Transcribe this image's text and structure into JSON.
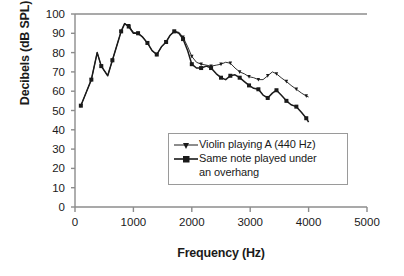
{
  "chart_data": {
    "type": "line",
    "title": "",
    "xlabel": "Frequency (Hz)",
    "ylabel": "Decibels (dB SPL)",
    "xlim": [
      0,
      5000
    ],
    "ylim": [
      0,
      100
    ],
    "xticks": [
      "0",
      "1000",
      "2000",
      "3000",
      "4000",
      "5000"
    ],
    "yticks": [
      "0",
      "10",
      "20",
      "30",
      "40",
      "50",
      "60",
      "70",
      "80",
      "90",
      "100"
    ],
    "grid": false,
    "legend_position": "inside-center-right",
    "series": [
      {
        "name": "Violin playing A (440 Hz)",
        "marker": "triangle-down",
        "color": "#1a1a1a",
        "points": [
          [
            100,
            52.5
          ],
          [
            200,
            60
          ],
          [
            280,
            66
          ],
          [
            380,
            80
          ],
          [
            450,
            73
          ],
          [
            560,
            68
          ],
          [
            640,
            76
          ],
          [
            730,
            85
          ],
          [
            790,
            91
          ],
          [
            850,
            95
          ],
          [
            920,
            94
          ],
          [
            1000,
            90.5
          ],
          [
            1080,
            90
          ],
          [
            1160,
            88
          ],
          [
            1240,
            85
          ],
          [
            1320,
            81
          ],
          [
            1400,
            79
          ],
          [
            1480,
            83
          ],
          [
            1560,
            85.5
          ],
          [
            1630,
            89
          ],
          [
            1700,
            91
          ],
          [
            1780,
            90.5
          ],
          [
            1850,
            88
          ],
          [
            1930,
            83
          ],
          [
            2000,
            78
          ],
          [
            2080,
            75
          ],
          [
            2160,
            74
          ],
          [
            2250,
            73.5
          ],
          [
            2330,
            73
          ],
          [
            2420,
            73.5
          ],
          [
            2500,
            74
          ],
          [
            2580,
            75
          ],
          [
            2660,
            74.5
          ],
          [
            2740,
            72
          ],
          [
            2820,
            70
          ],
          [
            2900,
            69
          ],
          [
            2980,
            67.5
          ],
          [
            3060,
            67
          ],
          [
            3140,
            66
          ],
          [
            3220,
            66
          ],
          [
            3300,
            68
          ],
          [
            3380,
            70
          ],
          [
            3450,
            69
          ],
          [
            3530,
            67
          ],
          [
            3620,
            65
          ],
          [
            3700,
            63
          ],
          [
            3790,
            61
          ],
          [
            3880,
            59
          ],
          [
            3960,
            57.5
          ],
          [
            4000,
            57
          ]
        ]
      },
      {
        "name": "Same note played under an overhang",
        "marker": "square",
        "color": "#1a1a1a",
        "points": [
          [
            100,
            52.5
          ],
          [
            200,
            60
          ],
          [
            280,
            66
          ],
          [
            380,
            80
          ],
          [
            450,
            73
          ],
          [
            560,
            68
          ],
          [
            640,
            76
          ],
          [
            730,
            85
          ],
          [
            790,
            91
          ],
          [
            850,
            95
          ],
          [
            920,
            93.5
          ],
          [
            1000,
            90
          ],
          [
            1080,
            90
          ],
          [
            1160,
            88
          ],
          [
            1240,
            85
          ],
          [
            1320,
            81
          ],
          [
            1400,
            79
          ],
          [
            1480,
            83
          ],
          [
            1560,
            85.5
          ],
          [
            1630,
            89
          ],
          [
            1700,
            91
          ],
          [
            1780,
            90
          ],
          [
            1850,
            87
          ],
          [
            1930,
            81
          ],
          [
            2000,
            74
          ],
          [
            2080,
            72
          ],
          [
            2160,
            72
          ],
          [
            2250,
            73
          ],
          [
            2330,
            72
          ],
          [
            2420,
            69
          ],
          [
            2500,
            67
          ],
          [
            2580,
            66
          ],
          [
            2660,
            68
          ],
          [
            2740,
            68.5
          ],
          [
            2820,
            67
          ],
          [
            2900,
            65
          ],
          [
            2980,
            63
          ],
          [
            3060,
            61.5
          ],
          [
            3140,
            61
          ],
          [
            3220,
            58
          ],
          [
            3300,
            56.5
          ],
          [
            3380,
            59
          ],
          [
            3450,
            60.5
          ],
          [
            3530,
            58
          ],
          [
            3620,
            55
          ],
          [
            3700,
            53
          ],
          [
            3790,
            52
          ],
          [
            3880,
            49
          ],
          [
            3960,
            46
          ],
          [
            4000,
            44
          ]
        ]
      }
    ]
  },
  "legend": {
    "entries": [
      {
        "label": "Violin playing A (440 Hz)",
        "label_line2": ""
      },
      {
        "label": "Same note played under",
        "label_line2": "an overhang"
      }
    ]
  },
  "colors": {
    "axis": "#8c8c8c",
    "ink": "#1a1a1a",
    "background": "#ffffff",
    "legend_border": "#9a9a9a"
  }
}
